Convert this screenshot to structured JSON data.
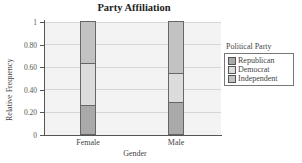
{
  "chart_data": {
    "type": "bar",
    "stacked": true,
    "title": "Party Affiliation",
    "xlabel": "Gender",
    "ylabel": "Relative Frequency",
    "ylim": [
      0,
      1
    ],
    "yticks": [
      "0",
      "0.20",
      "0.40",
      "0.60",
      "0.80",
      "1"
    ],
    "categories": [
      "Female",
      "Male"
    ],
    "series": [
      {
        "name": "Republican",
        "values": [
          0.26,
          0.28
        ],
        "color": "#a9a9a9"
      },
      {
        "name": "Democrat",
        "values": [
          0.37,
          0.26
        ],
        "color": "#dcdcdc"
      },
      {
        "name": "Independent",
        "values": [
          0.37,
          0.46
        ],
        "color": "#c2c2c2"
      }
    ],
    "grid": true,
    "legend": {
      "title": "Political Party",
      "position": "right"
    }
  }
}
